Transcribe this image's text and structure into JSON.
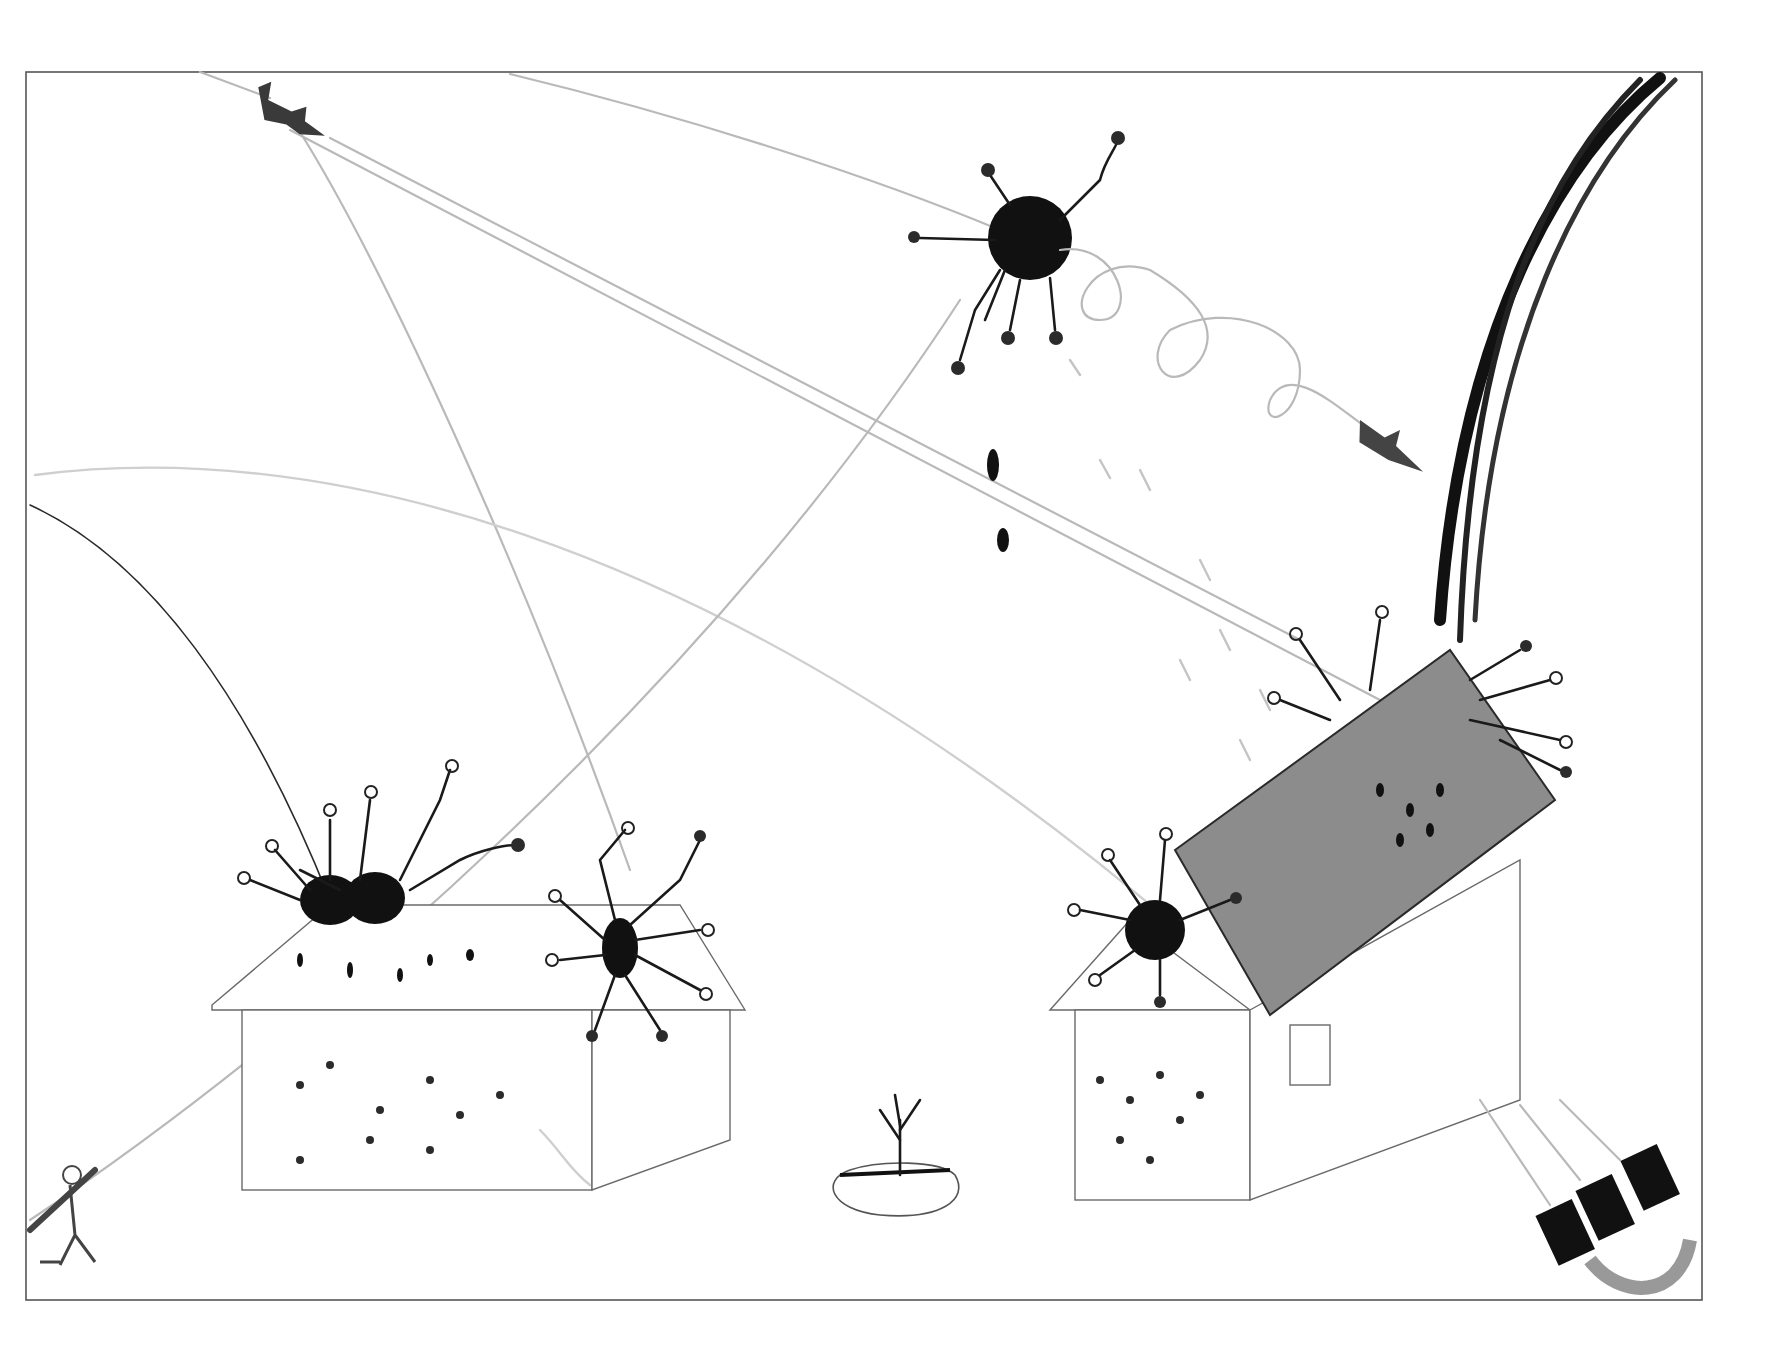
{
  "artwork": {
    "medium": "pencil and marker drawing",
    "palette": {
      "paper": "#ffffff",
      "frame": "#555555",
      "ink": "#111111",
      "pencil": "#b9b9b9",
      "roof_shade": "#8c8c8c"
    },
    "elements": [
      "frame-border",
      "aircraft-top-left",
      "helicopter-right",
      "central-explosion-airburst",
      "left-house-with-explosions",
      "right-house-roof-blown",
      "small-tree-on-mound",
      "figure-with-weapon-lower-left",
      "missile-pod-lower-right",
      "heavy-smoke-trail-right"
    ]
  }
}
